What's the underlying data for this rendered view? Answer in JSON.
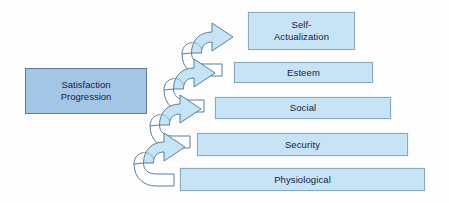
{
  "diagram": {
    "colors": {
      "level_fill": "#c7e3f6",
      "level_border": "#8aa9bd",
      "legend_fill": "#a3c6e7",
      "legend_border": "#60799a",
      "arrow_fill": "#c7e3f6",
      "arrow_top_fill": "#ffffff",
      "arrow_stroke": "#5a7f96",
      "text_color": "#16213d",
      "background": "#fdfdfd"
    },
    "legend": {
      "label": "Satisfaction\nProgression"
    },
    "levels": [
      {
        "label": "Self-\nActualization",
        "rank": 5,
        "x": 248,
        "y": 12,
        "width": 107,
        "height": 38
      },
      {
        "label": "Esteem",
        "rank": 4,
        "x": 234,
        "y": 62,
        "width": 139,
        "height": 21
      },
      {
        "label": "Social",
        "rank": 3,
        "x": 215,
        "y": 97,
        "width": 176,
        "height": 22
      },
      {
        "label": "Security",
        "rank": 2,
        "x": 197,
        "y": 133,
        "width": 211,
        "height": 23
      },
      {
        "label": "Physiological",
        "rank": 1,
        "x": 180,
        "y": 168,
        "width": 245,
        "height": 23
      }
    ],
    "arrows": [
      {
        "name": "arrow-to-self-actualization",
        "x": 178,
        "y": 18
      },
      {
        "name": "arrow-to-esteem",
        "x": 160,
        "y": 54
      },
      {
        "name": "arrow-to-social",
        "x": 146,
        "y": 90
      },
      {
        "name": "arrow-to-security",
        "x": 130,
        "y": 128
      }
    ]
  }
}
